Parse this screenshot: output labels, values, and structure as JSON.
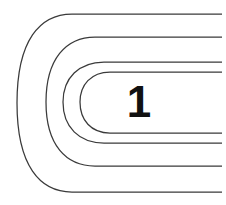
{
  "figure": {
    "type": "contour-diagram",
    "width": 226,
    "height": 205,
    "background_color": "#ffffff",
    "stroke_color": "#3a3a3a",
    "stroke_width": 1.25,
    "label_color": "#111111"
  },
  "label": {
    "text": "1",
    "x": 139,
    "y": 103,
    "font_size": 44
  },
  "contours": [
    {
      "name": "contour-outer",
      "index": 1,
      "top_y": 14,
      "bottom_y": 192,
      "left_x": 17,
      "right_x": 222,
      "path": "M 222 14 L 72 14 C 40 14 17 40 17 103 C 17 166 40 192 72 192 L 222 192"
    },
    {
      "name": "contour-second",
      "index": 2,
      "top_y": 37,
      "bottom_y": 166,
      "left_x": 46,
      "right_x": 222,
      "path": "M 222 37 L 95 37 C 66 37 46 59 46 102 C 46 145 66 166 95 166 L 222 166"
    },
    {
      "name": "contour-third",
      "index": 3,
      "top_y": 62,
      "bottom_y": 143,
      "left_x": 63,
      "right_x": 222,
      "path": "M 222 62 L 104 62 C 79 62 63 78 63 102 C 63 127 79 143 104 143 L 222 143"
    },
    {
      "name": "contour-inner",
      "index": 4,
      "top_y": 72,
      "bottom_y": 133,
      "left_x": 80,
      "right_x": 222,
      "path": "M 222 72 L 110 72 C 91 72 80 85 80 102 C 80 120 91 133 110 133 L 222 133"
    }
  ]
}
